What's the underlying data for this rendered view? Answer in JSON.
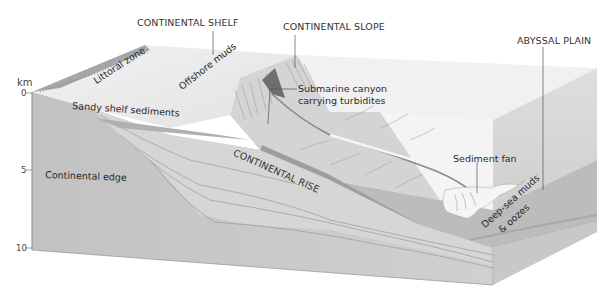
{
  "diagram": {
    "scale": {
      "unit": "km",
      "ticks": [
        "0",
        "5",
        "10"
      ]
    },
    "headings": {
      "continental_shelf": "CONTINENTAL SHELF",
      "continental_slope": "CONTINENTAL SLOPE",
      "abyssal_plain": "ABYSSAL PLAIN",
      "continental_rise": "CONTINENTAL RISE"
    },
    "labels": {
      "littoral_zone": "Littoral zone",
      "offshore_muds": "Offshore muds",
      "sandy_shelf_sediments": "Sandy shelf sediments",
      "submarine_canyon_line1": "Submarine canyon",
      "submarine_canyon_line2": "carrying turbidites",
      "continental_edge": "Continental edge",
      "sediment_fan": "Sediment fan",
      "deep_sea_line1": "Deep-sea muds",
      "deep_sea_line2": "& oozes"
    },
    "colors": {
      "front_face": "#c4c4c4",
      "shelf_top": "#ececec",
      "slope": "#d6d6d6",
      "rise_band": "#b4b4b4",
      "abyssal_floor": "#bdbdbd",
      "water": "#efefef",
      "littoral": "#9e9e9e",
      "fan": "#f6f6f6",
      "leader_line": "#555555"
    }
  }
}
